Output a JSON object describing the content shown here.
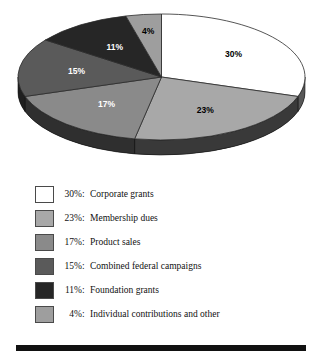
{
  "chart_data": {
    "type": "pie",
    "title": "",
    "subtitle": "",
    "xlabel": "",
    "ylabel": "",
    "legend_position": "bottom-left",
    "grid": false,
    "three_d": true,
    "start_angle_deg": 0,
    "direction": "clockwise",
    "categories": [
      "Corporate grants",
      "Membership dues",
      "Product sales",
      "Combined federal campaigns",
      "Foundation grants",
      "Individual contributions and other"
    ],
    "values": [
      30,
      23,
      17,
      15,
      11,
      4
    ],
    "value_labels": [
      "30%",
      "23%",
      "17%",
      "15%",
      "11%",
      "4%"
    ],
    "units": "percent",
    "total": "100",
    "colors": [
      "#ffffff",
      "#a8a8a8",
      "#8a8a8a",
      "#5a5a5a",
      "#262626",
      "#9e9e9e"
    ],
    "label_text_colors": [
      "#000000",
      "#000000",
      "#ffffff",
      "#ffffff",
      "#ffffff",
      "#000000"
    ],
    "slices": [
      {
        "label": "30%",
        "value": 30,
        "name": "Corporate grants",
        "color": "#ffffff"
      },
      {
        "label": "23%",
        "value": 23,
        "name": "Membership dues",
        "color": "#a8a8a8"
      },
      {
        "label": "17%",
        "value": 17,
        "name": "Product sales",
        "color": "#8a8a8a"
      },
      {
        "label": "15%",
        "value": 15,
        "name": "Combined federal campaigns",
        "color": "#5a5a5a"
      },
      {
        "label": "11%",
        "value": 11,
        "name": "Foundation grants",
        "color": "#262626"
      },
      {
        "label": "4%",
        "value": 4,
        "name": "Individual contributions and other",
        "color": "#9e9e9e"
      }
    ]
  },
  "legend": {
    "rows": [
      {
        "pct": "30%",
        "colon": ":",
        "name": "Corporate grants",
        "swatch": "#ffffff"
      },
      {
        "pct": "23%",
        "colon": ":",
        "name": "Membership dues",
        "swatch": "#a8a8a8"
      },
      {
        "pct": "17%",
        "colon": ":",
        "name": "Product sales",
        "swatch": "#8a8a8a"
      },
      {
        "pct": "15%",
        "colon": ":",
        "name": "Combined federal campaigns",
        "swatch": "#5a5a5a"
      },
      {
        "pct": "11%",
        "colon": ":",
        "name": "Foundation grants",
        "swatch": "#262626"
      },
      {
        "pct": "4%",
        "colon": ":",
        "name": "Individual contributions and other",
        "swatch": "#9e9e9e"
      }
    ]
  },
  "rule": {
    "color": "#111111"
  }
}
